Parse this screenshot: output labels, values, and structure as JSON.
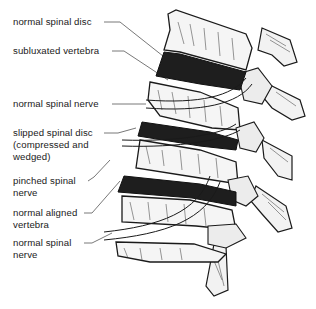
{
  "diagram": {
    "title": "",
    "colors": {
      "ink": "#1a1a1a",
      "bone": "#f4f4f4",
      "shadow": "#222222",
      "leader": "#555555"
    },
    "labels": [
      {
        "id": "normal-spinal-disc",
        "text": "normal spinal disc"
      },
      {
        "id": "subluxated-vertebra",
        "text": "subluxated vertebra"
      },
      {
        "id": "normal-spinal-nerve-top",
        "text": "normal spinal nerve"
      },
      {
        "id": "slipped-spinal-disc",
        "text": "slipped spinal disc\n(compressed and\nwedged)"
      },
      {
        "id": "pinched-spinal-nerve",
        "text": "pinched spinal\nnerve"
      },
      {
        "id": "normal-aligned-vertebra",
        "text": "normal aligned\nvertebra"
      },
      {
        "id": "normal-spinal-nerve-bottom",
        "text": "normal spinal\nnerve"
      }
    ]
  }
}
